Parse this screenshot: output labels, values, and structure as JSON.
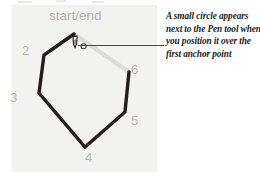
{
  "figure": {
    "kind": "pen-tool-close-path-illustration",
    "panel_color": "#f2f2f1",
    "page_background": "#ffffff"
  },
  "illustration": {
    "shape": "hexagon",
    "start_end_label": "start/end",
    "stroke_color_dark": "#231f20",
    "stroke_color_light": "#dcdcdc",
    "anchor_numbers": [
      {
        "label": "2",
        "x": 22,
        "y": 44
      },
      {
        "label": "3",
        "x": 10,
        "y": 91
      },
      {
        "label": "4",
        "x": 85,
        "y": 151
      },
      {
        "label": "5",
        "x": 131,
        "y": 114
      },
      {
        "label": "6",
        "x": 131,
        "y": 63
      }
    ],
    "cursor": {
      "tool": "pen-tool",
      "badge": "small-circle",
      "badge_color": "#3a3a3a"
    }
  },
  "callout": {
    "leader_line_color": "#4a4a4a",
    "lines": [
      "A small circle appears",
      "next to the Pen tool when",
      "you position it over the",
      "first anchor point"
    ],
    "text": "A small circle appears next to the Pen tool when you position it over the first anchor point"
  }
}
